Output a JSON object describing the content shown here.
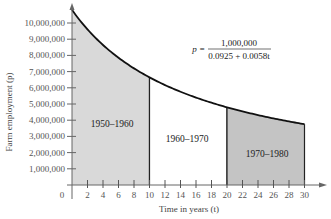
{
  "chart_data": {
    "type": "area",
    "title": "",
    "formula": {
      "lhs": "p =",
      "numerator": "1,000,000",
      "denominator": "0.0925 + 0.0058t"
    },
    "xlabel": "Time in years (t)",
    "ylabel": "Farm employment (p)",
    "xlim": [
      0,
      30
    ],
    "ylim": [
      0,
      10000000
    ],
    "x_ticks": [
      0,
      2,
      4,
      6,
      8,
      10,
      12,
      14,
      16,
      18,
      20,
      22,
      24,
      26,
      28,
      30
    ],
    "x_tick_labels": [
      "0",
      "2",
      "4",
      "6",
      "8",
      "10",
      "12",
      "14",
      "16",
      "18",
      "20",
      "22",
      "24",
      "26",
      "28",
      "30"
    ],
    "y_ticks": [
      1000000,
      2000000,
      3000000,
      4000000,
      5000000,
      6000000,
      7000000,
      8000000,
      9000000,
      10000000
    ],
    "y_tick_labels": [
      "1,000,000",
      "2,000,000",
      "3,000,000",
      "4,000,000",
      "5,000,000",
      "6,000,000",
      "7,000,000",
      "8,000,000",
      "9,000,000",
      "10,000,000"
    ],
    "series": [
      {
        "name": "p(t) = 1,000,000 / (0.0925 + 0.0058t)",
        "x": [
          0,
          5,
          10,
          15,
          20,
          25,
          30
        ],
        "values": [
          10810811,
          8291874,
          6734007,
          5671078,
          4899559,
          4312668,
          3853565
        ]
      }
    ],
    "regions": [
      {
        "label": "1950–1960",
        "t_start": 0,
        "t_end": 10,
        "fill": "#d9d9d9"
      },
      {
        "label": "1960–1970",
        "t_start": 10,
        "t_end": 20,
        "fill": "#ffffff"
      },
      {
        "label": "1970–1980",
        "t_start": 20,
        "t_end": 30,
        "fill": "#c4c4c4"
      }
    ],
    "grid": false,
    "legend": "none"
  }
}
